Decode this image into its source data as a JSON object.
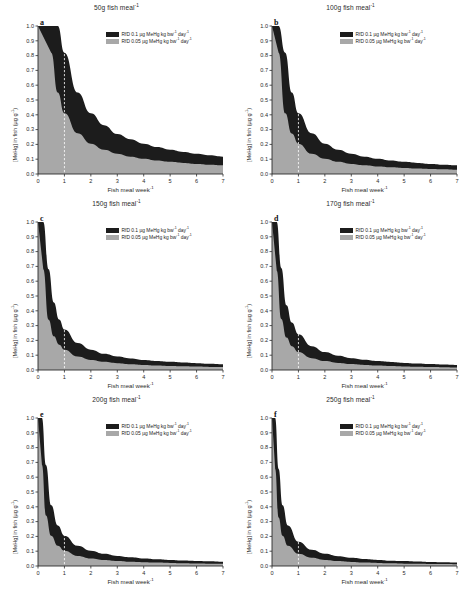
{
  "figure": {
    "axis_labels": {
      "y": "[MeHg] in fish (µg g⁻¹)",
      "x": "Fish meal week⁻¹"
    },
    "legend": {
      "black_label": "RfD 0.1 µg MeHg kg bw⁻¹ day⁻¹",
      "grey_label": "RfD 0.05 µg MeHg kg bw⁻¹ day⁻¹",
      "black_color": "#1c1c1c",
      "grey_color": "#a8a8a8"
    },
    "y_ticks": [
      "0.0",
      "0.1",
      "0.2",
      "0.3",
      "0.4",
      "0.5",
      "0.6",
      "0.7",
      "0.8",
      "0.9",
      "1.0"
    ],
    "x_ticks": [
      "0",
      "1",
      "2",
      "3",
      "4",
      "5",
      "6",
      "7"
    ],
    "panels": [
      {
        "letter": "a",
        "title": "50g fish meal⁻¹"
      },
      {
        "letter": "b",
        "title": "100g fish meal⁻¹"
      },
      {
        "letter": "c",
        "title": "150g fish meal⁻¹"
      },
      {
        "letter": "d",
        "title": "170g fish meal⁻¹"
      },
      {
        "letter": "e",
        "title": "200g fish meal⁻¹"
      },
      {
        "letter": "f",
        "title": "250g fish meal⁻¹"
      }
    ]
  },
  "chart_data": [
    {
      "type": "area",
      "panel": "a",
      "title": "50g fish meal⁻¹",
      "xlabel": "Fish meal week⁻¹",
      "ylabel": "[MeHg] in fish (µg g⁻¹)",
      "xlim": [
        0,
        7
      ],
      "ylim": [
        0,
        1.0
      ],
      "grid": false,
      "legend_position": "top-right",
      "reference_line_x": 1,
      "series": [
        {
          "name": "RfD 0.1 µg MeHg kg bw⁻¹ day⁻¹",
          "color": "#1c1c1c",
          "x": [
            0.5,
            0.75,
            1,
            1.5,
            2,
            2.5,
            3,
            3.5,
            4,
            4.5,
            5,
            5.5,
            6,
            6.5,
            7
          ],
          "values": [
            1.0,
            1.0,
            0.82,
            0.55,
            0.41,
            0.33,
            0.27,
            0.235,
            0.205,
            0.182,
            0.164,
            0.149,
            0.137,
            0.126,
            0.117
          ]
        },
        {
          "name": "RfD 0.05 µg MeHg kg bw⁻¹ day⁻¹",
          "color": "#a8a8a8",
          "x": [
            0.5,
            0.75,
            1,
            1.5,
            2,
            2.5,
            3,
            3.5,
            4,
            4.5,
            5,
            5.5,
            6,
            6.5,
            7
          ],
          "values": [
            0.82,
            0.55,
            0.41,
            0.275,
            0.205,
            0.164,
            0.137,
            0.117,
            0.103,
            0.091,
            0.082,
            0.075,
            0.068,
            0.063,
            0.059
          ]
        }
      ]
    },
    {
      "type": "area",
      "panel": "b",
      "title": "100g fish meal⁻¹",
      "xlabel": "Fish meal week⁻¹",
      "ylabel": "[MeHg] in fish (µg g⁻¹)",
      "xlim": [
        0,
        7
      ],
      "ylim": [
        0,
        1.0
      ],
      "grid": false,
      "legend_position": "top-right",
      "reference_line_x": 1,
      "series": [
        {
          "name": "RfD 0.1 µg MeHg kg bw⁻¹ day⁻¹",
          "color": "#1c1c1c",
          "x": [
            0.25,
            0.5,
            0.75,
            1,
            1.5,
            2,
            2.5,
            3,
            3.5,
            4,
            4.5,
            5,
            5.5,
            6,
            6.5,
            7
          ],
          "values": [
            1.0,
            0.82,
            0.55,
            0.41,
            0.275,
            0.205,
            0.164,
            0.137,
            0.117,
            0.103,
            0.091,
            0.082,
            0.075,
            0.068,
            0.063,
            0.059
          ]
        },
        {
          "name": "RfD 0.05 µg MeHg kg bw⁻¹ day⁻¹",
          "color": "#a8a8a8",
          "x": [
            0.25,
            0.5,
            0.75,
            1,
            1.5,
            2,
            2.5,
            3,
            3.5,
            4,
            4.5,
            5,
            5.5,
            6,
            6.5,
            7
          ],
          "values": [
            0.82,
            0.41,
            0.273,
            0.205,
            0.137,
            0.103,
            0.082,
            0.068,
            0.059,
            0.051,
            0.046,
            0.041,
            0.037,
            0.034,
            0.032,
            0.029
          ]
        }
      ]
    },
    {
      "type": "area",
      "panel": "c",
      "title": "150g fish meal⁻¹",
      "xlabel": "Fish meal week⁻¹",
      "ylabel": "[MeHg] in fish (µg g⁻¹)",
      "xlim": [
        0,
        7
      ],
      "ylim": [
        0,
        1.0
      ],
      "grid": false,
      "legend_position": "top-right",
      "reference_line_x": 1,
      "series": [
        {
          "name": "RfD 0.1 µg MeHg kg bw⁻¹ day⁻¹",
          "color": "#1c1c1c",
          "x": [
            0.2,
            0.4,
            0.6,
            0.8,
            1,
            1.5,
            2,
            2.5,
            3,
            3.5,
            4,
            4.5,
            5,
            5.5,
            6,
            6.5,
            7
          ],
          "values": [
            1.0,
            0.68,
            0.456,
            0.342,
            0.273,
            0.182,
            0.137,
            0.109,
            0.091,
            0.078,
            0.068,
            0.061,
            0.055,
            0.05,
            0.046,
            0.042,
            0.039
          ]
        },
        {
          "name": "RfD 0.05 µg MeHg kg bw⁻¹ day⁻¹",
          "color": "#a8a8a8",
          "x": [
            0.2,
            0.4,
            0.6,
            0.8,
            1,
            1.5,
            2,
            2.5,
            3,
            3.5,
            4,
            4.5,
            5,
            5.5,
            6,
            6.5,
            7
          ],
          "values": [
            0.68,
            0.34,
            0.228,
            0.171,
            0.137,
            0.091,
            0.068,
            0.055,
            0.046,
            0.039,
            0.034,
            0.03,
            0.027,
            0.025,
            0.023,
            0.021,
            0.02
          ]
        }
      ]
    },
    {
      "type": "area",
      "panel": "d",
      "title": "170g fish meal⁻¹",
      "xlabel": "Fish meal week⁻¹",
      "ylabel": "[MeHg] in fish (µg g⁻¹)",
      "xlim": [
        0,
        7
      ],
      "ylim": [
        0,
        1.0
      ],
      "grid": false,
      "legend_position": "top-right",
      "reference_line_x": 1,
      "series": [
        {
          "name": "RfD 0.1 µg MeHg kg bw⁻¹ day⁻¹",
          "color": "#1c1c1c",
          "x": [
            0.18,
            0.35,
            0.55,
            0.75,
            1,
            1.5,
            2,
            2.5,
            3,
            3.5,
            4,
            4.5,
            5,
            5.5,
            6,
            6.5,
            7
          ],
          "values": [
            1.0,
            0.69,
            0.438,
            0.321,
            0.241,
            0.161,
            0.121,
            0.096,
            0.08,
            0.069,
            0.06,
            0.054,
            0.048,
            0.044,
            0.04,
            0.037,
            0.034
          ]
        },
        {
          "name": "RfD 0.05 µg MeHg kg bw⁻¹ day⁻¹",
          "color": "#a8a8a8",
          "x": [
            0.18,
            0.35,
            0.55,
            0.75,
            1,
            1.5,
            2,
            2.5,
            3,
            3.5,
            4,
            4.5,
            5,
            5.5,
            6,
            6.5,
            7
          ],
          "values": [
            0.67,
            0.345,
            0.219,
            0.161,
            0.121,
            0.08,
            0.06,
            0.048,
            0.04,
            0.034,
            0.03,
            0.027,
            0.024,
            0.022,
            0.02,
            0.019,
            0.017
          ]
        }
      ]
    },
    {
      "type": "area",
      "panel": "e",
      "title": "200g fish meal⁻¹",
      "xlabel": "Fish meal week⁻¹",
      "ylabel": "[MeHg] in fish (µg g⁻¹)",
      "xlim": [
        0,
        7
      ],
      "ylim": [
        0,
        1.0
      ],
      "grid": false,
      "legend_position": "top-right",
      "reference_line_x": 1,
      "series": [
        {
          "name": "RfD 0.1 µg MeHg kg bw⁻¹ day⁻¹",
          "color": "#1c1c1c",
          "x": [
            0.15,
            0.3,
            0.5,
            0.75,
            1,
            1.5,
            2,
            2.5,
            3,
            3.5,
            4,
            4.5,
            5,
            5.5,
            6,
            6.5,
            7
          ],
          "values": [
            1.0,
            0.683,
            0.41,
            0.273,
            0.205,
            0.137,
            0.103,
            0.082,
            0.068,
            0.059,
            0.051,
            0.046,
            0.041,
            0.037,
            0.034,
            0.032,
            0.029
          ]
        },
        {
          "name": "RfD 0.05 µg MeHg kg bw⁻¹ day⁻¹",
          "color": "#a8a8a8",
          "x": [
            0.15,
            0.3,
            0.5,
            0.75,
            1,
            1.5,
            2,
            2.5,
            3,
            3.5,
            4,
            4.5,
            5,
            5.5,
            6,
            6.5,
            7
          ],
          "values": [
            0.683,
            0.342,
            0.205,
            0.137,
            0.103,
            0.068,
            0.051,
            0.041,
            0.034,
            0.029,
            0.026,
            0.023,
            0.021,
            0.019,
            0.017,
            0.016,
            0.015
          ]
        }
      ]
    },
    {
      "type": "area",
      "panel": "f",
      "title": "250g fish meal⁻¹",
      "xlabel": "Fish meal week⁻¹",
      "ylabel": "[MeHg] in fish (µg g⁻¹)",
      "xlim": [
        0,
        7
      ],
      "ylim": [
        0,
        1.0
      ],
      "grid": false,
      "legend_position": "top-right",
      "reference_line_x": 1,
      "series": [
        {
          "name": "RfD 0.1 µg MeHg kg bw⁻¹ day⁻¹",
          "color": "#1c1c1c",
          "x": [
            0.12,
            0.25,
            0.4,
            0.6,
            1,
            1.5,
            2,
            2.5,
            3,
            3.5,
            4,
            4.5,
            5,
            5.5,
            6,
            6.5,
            7
          ],
          "values": [
            1.0,
            0.656,
            0.41,
            0.273,
            0.164,
            0.109,
            0.082,
            0.066,
            0.055,
            0.047,
            0.041,
            0.036,
            0.033,
            0.03,
            0.027,
            0.025,
            0.023
          ]
        },
        {
          "name": "RfD 0.05 µg MeHg kg bw⁻¹ day⁻¹",
          "color": "#a8a8a8",
          "x": [
            0.12,
            0.25,
            0.4,
            0.6,
            1,
            1.5,
            2,
            2.5,
            3,
            3.5,
            4,
            4.5,
            5,
            5.5,
            6,
            6.5,
            7
          ],
          "values": [
            0.656,
            0.328,
            0.205,
            0.137,
            0.082,
            0.055,
            0.041,
            0.033,
            0.027,
            0.023,
            0.021,
            0.018,
            0.016,
            0.015,
            0.014,
            0.013,
            0.012
          ]
        }
      ]
    }
  ]
}
